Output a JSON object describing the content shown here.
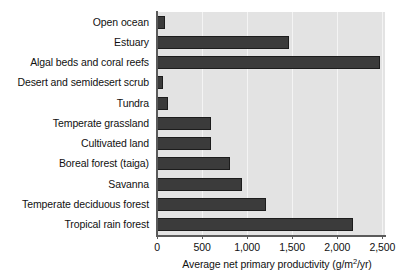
{
  "chart_data": {
    "type": "bar",
    "orientation": "horizontal",
    "title": "",
    "subtitle": "",
    "xlabel": "Average net primary productivity (g/m2/yr)",
    "xlabel_parts": {
      "before_sup": "Average net primary productivity (g/m",
      "sup": "2",
      "after_sup": "/yr)"
    },
    "ylabel": "",
    "categories": [
      "Open ocean",
      "Estuary",
      "Algal beds and coral reefs",
      "Desert and semidesert scrub",
      "Tundra",
      "Temperate grassland",
      "Cultivated land",
      "Boreal forest (taiga)",
      "Savanna",
      "Temperate deciduous forest",
      "Tropical rain forest"
    ],
    "values": [
      90,
      1460,
      2480,
      70,
      120,
      600,
      600,
      810,
      945,
      1210,
      2180
    ],
    "xlim": [
      0,
      2530
    ],
    "xticks": [
      0,
      500,
      1000,
      1500,
      2000,
      2500
    ],
    "xtick_labels": [
      "0",
      "500",
      "1,000",
      "1,500",
      "2,000",
      "2,500"
    ],
    "grid": "vertical",
    "legend": "none",
    "colors": {
      "bar_fill": "#3b3b3b",
      "bar_edge": "#1c1c1c",
      "plot_background": "#e3e3e3",
      "gridline": "#f4f4f4",
      "axis_line": "#5a5a5a",
      "figure_background": "#ffffff",
      "text": "#111111"
    }
  }
}
